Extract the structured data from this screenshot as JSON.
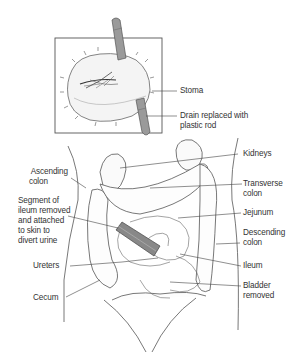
{
  "figure": {
    "type": "medical-illustration"
  },
  "inset": {
    "labels": {
      "stoma": "Stoma",
      "drain_line1": "Drain replaced with",
      "drain_line2": "plastic rod"
    }
  },
  "main": {
    "labels_left": {
      "ascending_line1": "Ascending",
      "ascending_line2": "colon",
      "segment_line1": "Segment of",
      "segment_line2": "ileum removed",
      "segment_line3": "and attached",
      "segment_line4": "to skin to",
      "segment_line5": "divert urine",
      "ureters": "Ureters",
      "cecum": "Cecum"
    },
    "labels_right": {
      "kidneys": "Kidneys",
      "transverse_line1": "Transverse",
      "transverse_line2": "colon",
      "jejunum": "Jejunum",
      "descending_line1": "Descending",
      "descending_line2": "colon",
      "ileum": "Ileum",
      "bladder_line1": "Bladder",
      "bladder_line2": "removed"
    }
  },
  "colors": {
    "line": "#444444",
    "text": "#333333",
    "rod_fill": "#9a9a9a",
    "background": "#ffffff"
  }
}
